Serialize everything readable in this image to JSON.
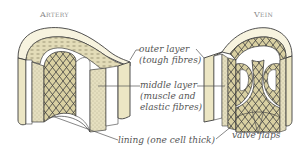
{
  "titles": {
    "artery": "Artery",
    "vein": "Vein"
  },
  "labels": {
    "outer_layer": "outer layer",
    "outer_layer_detail": "(tough fibres)",
    "middle_layer": "middle layer",
    "middle_layer_detail_1": "(muscle and",
    "middle_layer_detail_2": "elastic fibres)",
    "lining": "lining (one cell thick)",
    "valve_flaps": "valve flaps"
  },
  "colors": {
    "outer_fill": "#ece6c4",
    "middle_fill": "#e3dcb8",
    "lining_fill": "#d8cfa0",
    "outline": "#3d3d3d",
    "text": "#555555",
    "title": "#8a8a8a",
    "leader_line": "#555555"
  }
}
